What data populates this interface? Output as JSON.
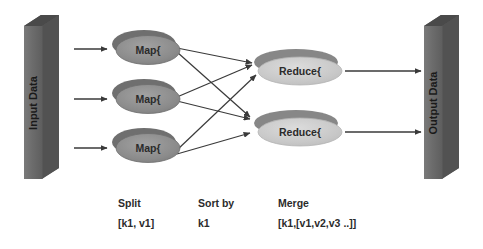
{
  "diagram": {
    "colors": {
      "background": "#ffffff",
      "cuboid_front": "#6e6e6e",
      "cuboid_top": "#4f4f4f",
      "cuboid_side": "#555555",
      "map_fill": "#8d8d8d",
      "map_back": "#6f6f6f",
      "reduce_fill": "#c9c9c9",
      "reduce_back": "#878787",
      "arrow": "#3a3a3a",
      "text": "#2b2b2b"
    },
    "input_block": {
      "label": "Input Data"
    },
    "output_block": {
      "label": "Output Data"
    },
    "map_nodes": [
      {
        "label": "Map{"
      },
      {
        "label": "Map{"
      },
      {
        "label": "Map{"
      }
    ],
    "reduce_nodes": [
      {
        "label": "Reduce{"
      },
      {
        "label": "Reduce{"
      }
    ],
    "captions": [
      {
        "heading": "Split",
        "value": "[k1, v1]"
      },
      {
        "heading": "Sort by",
        "value": "k1"
      },
      {
        "heading": "Merge",
        "value": "[k1,[v1,v2,v3 ..]]"
      }
    ],
    "edges": {
      "input_to_map_count": 3,
      "map_to_reduce_count": 6,
      "reduce_to_output_count": 2
    }
  }
}
